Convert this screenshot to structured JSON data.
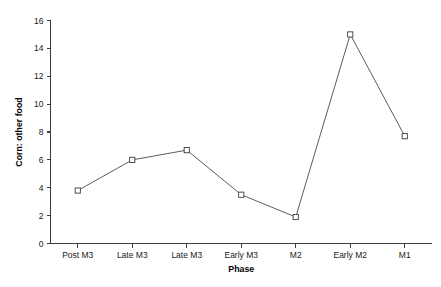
{
  "chart_data": {
    "type": "line",
    "title": "",
    "xlabel": "Phase",
    "ylabel": "Corn: other food",
    "categories": [
      "Post M3",
      "Late M3",
      "Late M3",
      "Early M3",
      "M2",
      "Early M2",
      "M1"
    ],
    "values": [
      3.8,
      6.0,
      6.7,
      3.5,
      1.9,
      15.0,
      7.7
    ],
    "series": [
      {
        "name": "Corn: other food",
        "values": [
          3.8,
          6.0,
          6.7,
          3.5,
          1.9,
          15.0,
          7.7
        ]
      }
    ],
    "ylim": [
      0,
      16
    ],
    "yticks": [
      0,
      2,
      4,
      6,
      8,
      10,
      12,
      14,
      16
    ],
    "ytick_labels": [
      "0",
      "2",
      "4",
      "6",
      "8",
      "10",
      "12",
      "14",
      "16"
    ],
    "grid": false,
    "legend": false,
    "marker": "open-square",
    "line_color": "#4a4a4a",
    "marker_fill": "#ffffff",
    "marker_edge": "#3c3c3c",
    "background": "#ffffff"
  }
}
